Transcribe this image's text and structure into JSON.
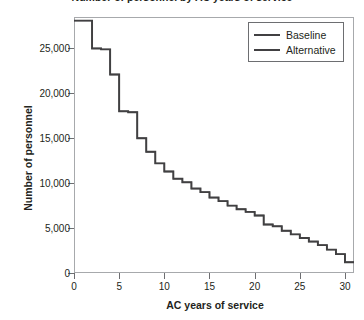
{
  "chart_data": {
    "type": "line",
    "title": "Number of personnel by AC years of service",
    "xlabel": "AC years of service",
    "ylabel": "Number of personnel",
    "xlim": [
      0,
      31
    ],
    "ylim": [
      0,
      28500
    ],
    "grid": false,
    "drawstyle": "steps-post",
    "legend_position": "upper right",
    "xticks": [
      0,
      5,
      10,
      15,
      20,
      25,
      30
    ],
    "xtick_labels": [
      "0",
      "5",
      "10",
      "15",
      "20",
      "25",
      "30"
    ],
    "yticks": [
      0,
      5000,
      10000,
      15000,
      20000,
      25000
    ],
    "ytick_labels": [
      "0",
      "5,000",
      "10,000",
      "15,000",
      "20,000",
      "25,000"
    ],
    "x": [
      0,
      1,
      2,
      3,
      4,
      5,
      6,
      7,
      8,
      9,
      10,
      11,
      12,
      13,
      14,
      15,
      16,
      17,
      18,
      19,
      20,
      21,
      22,
      23,
      24,
      25,
      26,
      27,
      28,
      29,
      30
    ],
    "series": [
      {
        "name": "Baseline",
        "color": "#414042",
        "values": [
          28100,
          28100,
          25000,
          24900,
          22100,
          18000,
          17900,
          15000,
          13500,
          12200,
          11300,
          10500,
          10100,
          9400,
          9000,
          8400,
          8000,
          7500,
          7100,
          6800,
          6400,
          6200,
          6100,
          6050,
          6000,
          5950,
          5900,
          5300,
          5000,
          4700,
          4350
        ]
      },
      {
        "name": "Alternative",
        "color": "#414042",
        "values": [
          28100,
          28100,
          25000,
          24900,
          22100,
          18000,
          17900,
          15000,
          13500,
          12200,
          11300,
          10500,
          10100,
          9400,
          9000,
          8400,
          8000,
          7500,
          7100,
          6800,
          6400,
          6200,
          6100,
          6050,
          6000,
          5950,
          5900,
          5300,
          5000,
          4700,
          4350
        ]
      }
    ],
    "series_tail": {
      "note": "values continue declining after year 20",
      "x_tail": [
        20,
        21,
        22,
        23,
        24,
        25,
        26,
        27,
        28,
        29,
        30
      ],
      "values_tail": [
        6000,
        5400,
        5200,
        4700,
        4300,
        3900,
        3500,
        3100,
        2600,
        2100,
        1200
      ]
    }
  },
  "legend": {
    "items": [
      {
        "label": "Baseline"
      },
      {
        "label": "Alternative"
      }
    ]
  }
}
